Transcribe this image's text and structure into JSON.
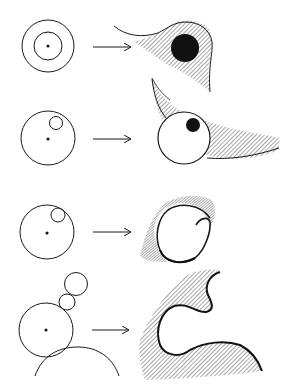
{
  "figure": {
    "colors": {
      "stroke": "#1a1a1a",
      "hatch": "#3a3a3a",
      "fill_dark": "#111111",
      "background": "#ffffff"
    },
    "rows": [
      {
        "id": 1,
        "left": "concentric circles with center dot",
        "arrow": "right-arrow",
        "right": "hatched teardrop shape with dark filled circle"
      },
      {
        "id": 2,
        "left": "large circle with small circle inside near top-right, center dot",
        "arrow": "right-arrow",
        "right": "white circle with dark dot in front of hatched crescent band"
      },
      {
        "id": 3,
        "left": "large circle with small circle internally tangent at top-right, center dot",
        "arrow": "right-arrow",
        "right": "spiral curl with shading"
      },
      {
        "id": 4,
        "left": "circle with two small stacked circles above and large arc below, center dot",
        "arrow": "right-arrow",
        "right": "hatched wave shape with curl"
      }
    ]
  }
}
